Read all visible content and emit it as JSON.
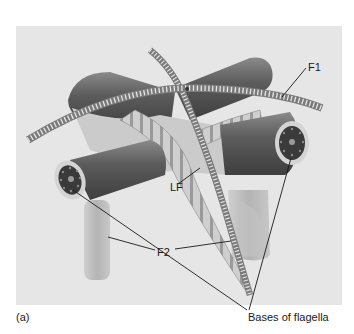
{
  "figure": {
    "panel_label": "(a)",
    "labels": {
      "f1": "F1",
      "lf": "LF",
      "f2": "F2",
      "bases": "Bases of flagella"
    },
    "colors": {
      "background": "#ffffff",
      "panel": "#e6e6e6",
      "tube_dark": "#5a5a5a",
      "tube_light": "#bdbdbd",
      "flagellum": "#d8d8d8",
      "leader_line": "#1a1a1a"
    }
  }
}
